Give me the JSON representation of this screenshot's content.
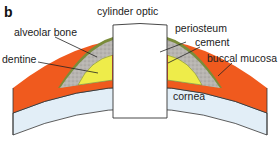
{
  "panel_label": "b",
  "labels": {
    "cylinder_optic": "cylinder optic",
    "alveolar_bone": "alveolar bone",
    "periosteum": "periosteum",
    "dentine": "dentine",
    "cement": "cement",
    "buccal_mucosa": "buccal mucosa",
    "cornea": "cornea"
  },
  "colors": {
    "buccal_mucosa": "#f05a1e",
    "periosteum": "#7a8c3a",
    "alveolar_bone": "#b5b2ae",
    "dentine": "#eeec4a",
    "cement": "#e0302a",
    "cornea": "#e2eef7",
    "outline": "#333333"
  }
}
